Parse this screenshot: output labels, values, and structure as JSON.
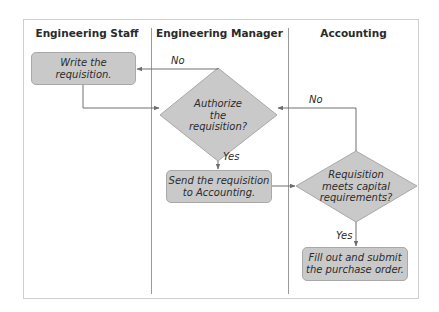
{
  "diagram": {
    "type": "swimlane-flowchart",
    "lanes": [
      {
        "id": "staff",
        "title": "Engineering Staff"
      },
      {
        "id": "manager",
        "title": "Engineering Manager"
      },
      {
        "id": "accounting",
        "title": "Accounting"
      }
    ],
    "nodes": {
      "write": {
        "shape": "rounded-rect",
        "lane": "staff",
        "text": "Write the requisition."
      },
      "authorize": {
        "shape": "diamond",
        "lane": "manager",
        "lines": [
          "Authorize",
          "the",
          "requisition?"
        ]
      },
      "send": {
        "shape": "rounded-rect",
        "lane": "manager",
        "lines": [
          "Send the requisition",
          "to Accounting."
        ]
      },
      "capital": {
        "shape": "diamond",
        "lane": "accounting",
        "lines": [
          "Requisition",
          "meets capital",
          "requirements?"
        ]
      },
      "fill": {
        "shape": "rounded-rect",
        "lane": "accounting",
        "lines": [
          "Fill out and submit",
          "the purchase order."
        ]
      }
    },
    "edges": [
      {
        "from": "write",
        "to": "authorize",
        "label": ""
      },
      {
        "from": "authorize",
        "to": "write",
        "label": "No"
      },
      {
        "from": "authorize",
        "to": "send",
        "label": "Yes"
      },
      {
        "from": "send",
        "to": "capital",
        "label": ""
      },
      {
        "from": "capital",
        "to": "authorize",
        "label": "No"
      },
      {
        "from": "capital",
        "to": "fill",
        "label": "Yes"
      }
    ],
    "edge_labels": {
      "auth_no": "No",
      "auth_yes": "Yes",
      "capital_no": "No",
      "capital_yes": "Yes"
    },
    "colors": {
      "node_fill": "#c9c9c9",
      "node_border": "#a8a8a8",
      "line": "#6e6e6e",
      "divider": "#9a9a9a",
      "frame": "#cfcfcf"
    }
  }
}
